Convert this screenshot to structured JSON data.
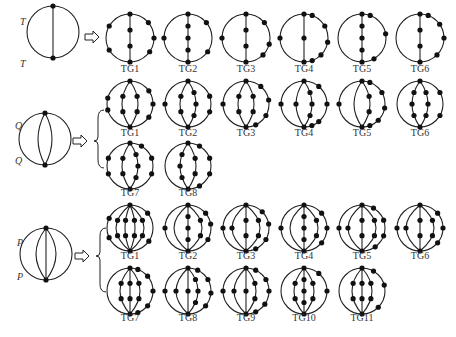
{
  "figure": {
    "sections": [
      {
        "name": "T",
        "source_label_top": "T",
        "source_label_bottom": "T",
        "source_inner_arcs": 1,
        "results": [
          {
            "label": "TG1"
          },
          {
            "label": "TG2"
          },
          {
            "label": "TG3"
          },
          {
            "label": "TG4"
          },
          {
            "label": "TG5"
          },
          {
            "label": "TG6"
          }
        ]
      },
      {
        "name": "Q",
        "source_label_top": "Q",
        "source_label_bottom": "Q",
        "source_inner_arcs": 2,
        "results": [
          {
            "label": "TG1"
          },
          {
            "label": "TG2"
          },
          {
            "label": "TG3"
          },
          {
            "label": "TG4"
          },
          {
            "label": "TG5"
          },
          {
            "label": "TG6"
          },
          {
            "label": "TG7"
          },
          {
            "label": "TG8"
          }
        ]
      },
      {
        "name": "P",
        "source_label_top": "P",
        "source_label_bottom": "P",
        "source_inner_arcs": 3,
        "results": [
          {
            "label": "TG1"
          },
          {
            "label": "TG2"
          },
          {
            "label": "TG3"
          },
          {
            "label": "TG4"
          },
          {
            "label": "TG5"
          },
          {
            "label": "TG6"
          },
          {
            "label": "TG7"
          },
          {
            "label": "TG8"
          },
          {
            "label": "TG9"
          },
          {
            "label": "TG10"
          },
          {
            "label": "TG11"
          }
        ]
      }
    ],
    "arrow_icon": "hollow-right-arrow",
    "brace_icon": "left-curly-brace",
    "colors": {
      "stroke": "#222222",
      "node": "#111111",
      "background": "#ffffff"
    }
  }
}
